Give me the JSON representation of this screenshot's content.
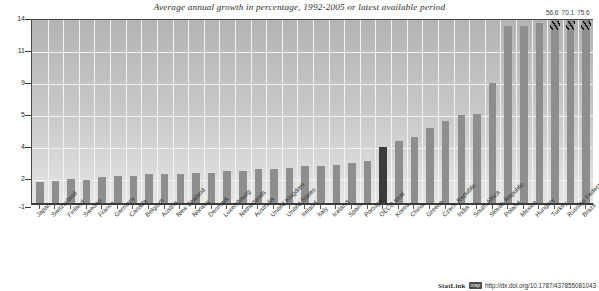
{
  "chart_data": {
    "type": "bar",
    "title": "Average annual growth in percentage, 1992-2005 or latest available period",
    "xlabel": "",
    "ylabel": "",
    "ylim": [
      -1,
      14
    ],
    "grid": true,
    "legend_position": "none",
    "y_tick_labels": [
      "14",
      "11",
      "9",
      "5",
      "4",
      "2",
      "-1"
    ],
    "y_tick_values": [
      14,
      11,
      9,
      5,
      4,
      2,
      -1
    ],
    "axis_note": "non-linear / compressed y-axis as printed",
    "highlight_category": "OECD total",
    "highlight_color": "#3b3b3b",
    "bar_color": "#8e8e8e",
    "plot_background": "#c4c4c4",
    "overflow_labels": [
      "56.6",
      "70.1",
      "75.6"
    ],
    "overflow_categories": [
      "Turkey",
      "Russian Federation",
      "Brazil"
    ],
    "categories": [
      "Japan",
      "Switzerland",
      "Finland",
      "Sweden",
      "France",
      "Germany",
      "Canada",
      "Belgium",
      "Austria",
      "New Zealand",
      "Norway",
      "Denmark",
      "Luxembourg",
      "Netherlands",
      "Australia",
      "United Kingdom",
      "United States",
      "Ireland",
      "Italy",
      "Iceland",
      "Spain",
      "Portugal",
      "OECD total",
      "Korea",
      "China",
      "Greece",
      "Czech Republic",
      "India",
      "South Africa",
      "Slovak Republic",
      "Poland",
      "Mexico",
      "Hungary",
      "Turkey",
      "Russian Federation",
      "Brazil"
    ],
    "values": [
      1.7,
      1.8,
      2.0,
      1.9,
      2.1,
      2.2,
      2.2,
      2.3,
      2.3,
      2.3,
      2.4,
      2.4,
      2.5,
      2.5,
      2.6,
      2.6,
      2.7,
      2.8,
      2.8,
      2.9,
      3.0,
      3.1,
      4.0,
      4.2,
      4.3,
      4.6,
      4.8,
      5.0,
      5.1,
      9.0,
      13.3,
      13.3,
      13.6,
      56.6,
      70.1,
      75.6
    ]
  },
  "footer": {
    "statlink_word": "StatLink",
    "statlink_badge": "msp",
    "url": "http://dx.doi.org/10.1787/437855081043"
  }
}
